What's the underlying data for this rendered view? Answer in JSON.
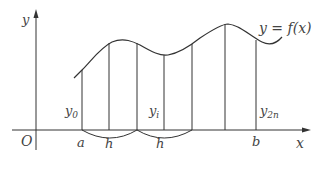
{
  "diagram": {
    "axis_labels": {
      "x": "x",
      "y": "y",
      "origin": "O"
    },
    "curve_label": "y = f(x)",
    "x_ticks": [
      {
        "label": "a"
      },
      {
        "label": "h"
      },
      {
        "label": "h"
      },
      {
        "label": "b"
      }
    ],
    "ordinate_labels": [
      {
        "label": "y",
        "sub": "0"
      },
      {
        "label": "y",
        "sub": "i"
      },
      {
        "label": "y",
        "sub": "2n"
      }
    ],
    "colors": {
      "stroke": "#333333",
      "text": "#444444",
      "background": "#ffffff"
    }
  }
}
